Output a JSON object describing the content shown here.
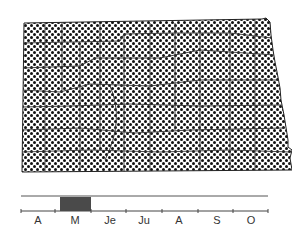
{
  "map": {
    "region": "North Dakota",
    "fill_pattern": "dot-stipple",
    "dot_color": "#111111",
    "border_color": "#222222",
    "distribution": "statewide"
  },
  "phenology": {
    "months": [
      "A",
      "M",
      "Je",
      "Ju",
      "A",
      "S",
      "O"
    ],
    "highlighted_month": "M",
    "highlight_color": "#4a4a4a"
  }
}
